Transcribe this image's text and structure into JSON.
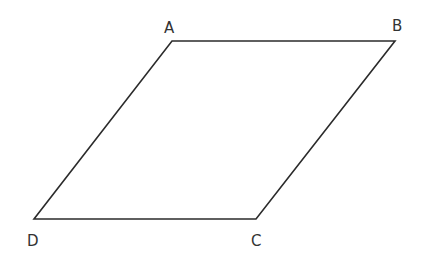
{
  "diagram": {
    "type": "parallelogram",
    "stroke_color": "#2b2b2b",
    "vertices": [
      {
        "label": "A",
        "x": 172,
        "y": 41
      },
      {
        "label": "B",
        "x": 395,
        "y": 41
      },
      {
        "label": "C",
        "x": 256,
        "y": 219
      },
      {
        "label": "D",
        "x": 34,
        "y": 219
      }
    ],
    "labels": {
      "A": "A",
      "B": "B",
      "C": "C",
      "D": "D"
    }
  }
}
